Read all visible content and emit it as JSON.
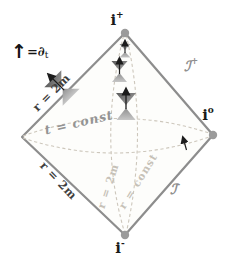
{
  "legend": {
    "arrow": "↑",
    "text": "=∂",
    "subscript": "t"
  },
  "vertices": {
    "i_plus": {
      "base": "i",
      "sup": "+"
    },
    "i_zero": {
      "base": "i",
      "sup": "o"
    },
    "i_minus": {
      "base": "i",
      "sup": "-"
    }
  },
  "null_infinity": {
    "scri_plus": {
      "base": "ℐ",
      "sup": "+"
    },
    "scri_minus": {
      "base": "ℐ",
      "sup": "-"
    }
  },
  "horizon_labels": {
    "upper": "r = 2m",
    "lower": "r = 2m"
  },
  "curve_labels": {
    "t_const": "t = const",
    "r_2m": "r = 2m",
    "r_const": "r = const"
  },
  "colors": {
    "edge": "#8d8d8d",
    "vertex_dot": "#9b9b9b",
    "dashed_curve": "#cdc7bc",
    "cone_dark": "#5f5f5f",
    "cone_light": "#c2c2c2",
    "arrow": "#1c1c1c",
    "label_dark": "#3f3f3f",
    "label_gray": "#8f8f8f",
    "label_faint": "#c6c1b7",
    "background": "#ffffff"
  }
}
